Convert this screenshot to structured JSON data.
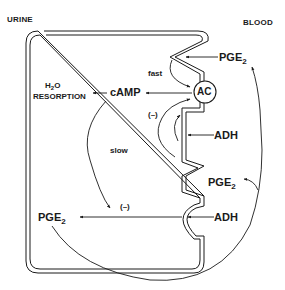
{
  "compartments": {
    "left": "URINE",
    "right": "BLOOD"
  },
  "cell": {
    "enzyme": "AC",
    "second_messenger": "cAMP",
    "effect_line1_main": "H",
    "effect_line1_sub": "2",
    "effect_line1_tail": "O",
    "effect_line2": "RESORPTION",
    "intracellular_pge2_main": "PGE",
    "intracellular_pge2_sub": "2"
  },
  "labels": {
    "fast": "fast",
    "slow": "slow",
    "inhibit_upper": "(–)",
    "inhibit_lower": "(–)"
  },
  "extracellular": {
    "pge2_top_main": "PGE",
    "pge2_top_sub": "2",
    "adh_upper": "ADH",
    "pge2_mid_main": "PGE",
    "pge2_mid_sub": "2",
    "adh_lower": "ADH"
  },
  "colors": {
    "ink": "#1a1a1a",
    "background": "#ffffff"
  }
}
